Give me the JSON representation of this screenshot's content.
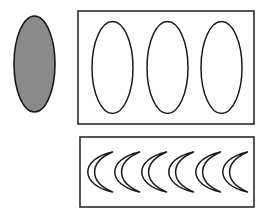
{
  "canvas": {
    "width": 265,
    "height": 215,
    "background": "#ffffff"
  },
  "palette": {
    "stroke": "#1a1a1a",
    "fill_gray": "#8a8a8a",
    "fill_white": "#ffffff",
    "box_stroke": "#2b2b2b"
  },
  "figure": {
    "title": "",
    "caption": ""
  },
  "shapes": {
    "filled_ellipse": {
      "label": "shaded-ellipse",
      "cx": 34.5,
      "cy": 64,
      "rx": 20.5,
      "ry": 48,
      "fill": "#8a8a8a",
      "stroke": "#1a1a1a",
      "stroke_width": 1.6
    },
    "top_box": {
      "label": "ellipse-group-box",
      "x": 78,
      "y": 11,
      "width": 176,
      "height": 113,
      "fill": "#ffffff",
      "stroke": "#2b2b2b",
      "stroke_width": 1.6
    },
    "bottom_box": {
      "label": "crescent-group-box",
      "x": 80,
      "y": 137,
      "width": 174,
      "height": 70,
      "fill": "#ffffff",
      "stroke": "#2b2b2b",
      "stroke_width": 1.6
    },
    "outline_ellipses": {
      "count": 3,
      "rx": 20.5,
      "ry": 46,
      "cy": 67.5,
      "cx_values": [
        112.5,
        167.5,
        221.5
      ],
      "fill": "#ffffff",
      "stroke": "#1a1a1a",
      "stroke_width": 1.5
    },
    "crescents": {
      "count": 6,
      "cy": 172,
      "cx_values": [
        104,
        131,
        158,
        185,
        212,
        239
      ],
      "height": 40,
      "width": 17,
      "opening": "right",
      "fill": "#ffffff",
      "stroke": "#1a1a1a",
      "stroke_width": 1.5
    }
  }
}
